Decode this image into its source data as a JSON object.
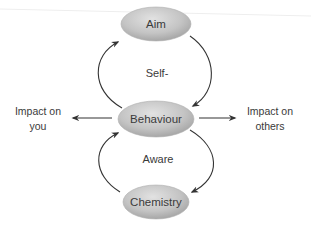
{
  "diagram": {
    "type": "cycle-diagram",
    "nodes": [
      {
        "id": "aim",
        "label": "Aim"
      },
      {
        "id": "behaviour",
        "label": "Behaviour"
      },
      {
        "id": "chemistry",
        "label": "Chemistry"
      }
    ],
    "loop_labels": {
      "upper": "Self-",
      "lower": "Aware"
    },
    "side_labels": {
      "left": {
        "line1": "Impact on",
        "line2": "you"
      },
      "right": {
        "line1": "Impact on",
        "line2": "others"
      }
    },
    "edges": [
      {
        "from": "aim",
        "to": "behaviour",
        "side": "right"
      },
      {
        "from": "behaviour",
        "to": "aim",
        "side": "left"
      },
      {
        "from": "behaviour",
        "to": "chemistry",
        "side": "right"
      },
      {
        "from": "chemistry",
        "to": "behaviour",
        "side": "left"
      },
      {
        "from": "behaviour",
        "to": "impact-on-you",
        "direction": "left"
      },
      {
        "from": "behaviour",
        "to": "impact-on-others",
        "direction": "right"
      }
    ],
    "colors": {
      "node_fill_light": "#dcdcdc",
      "node_fill_dark": "#a8a8a8",
      "line": "#333333",
      "text": "#3a3a3a"
    }
  }
}
